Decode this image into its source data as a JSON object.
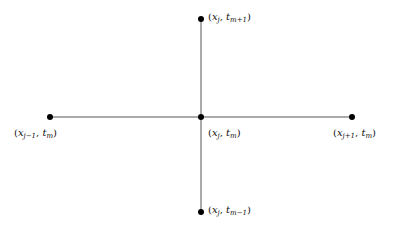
{
  "diagram": {
    "type": "finite-difference-stencil",
    "nodes": [
      {
        "id": "top",
        "x": 201,
        "y": 19,
        "var": "x",
        "var_sub": "j",
        "time": "t",
        "time_sub": "m+1"
      },
      {
        "id": "left",
        "x": 50,
        "y": 117,
        "var": "x",
        "var_sub": "j−1",
        "time": "t",
        "time_sub": "m"
      },
      {
        "id": "center",
        "x": 201,
        "y": 117,
        "var": "x",
        "var_sub": "j",
        "time": "t",
        "time_sub": "m"
      },
      {
        "id": "right",
        "x": 352,
        "y": 117,
        "var": "x",
        "var_sub": "j+1",
        "time": "t",
        "time_sub": "m"
      },
      {
        "id": "bottom",
        "x": 201,
        "y": 212,
        "var": "x",
        "var_sub": "j",
        "time": "t",
        "time_sub": "m−1"
      }
    ],
    "edges": [
      {
        "from": "left",
        "to": "right"
      },
      {
        "from": "top",
        "to": "bottom"
      }
    ],
    "colors": {
      "line": "#555555",
      "node": "#000000",
      "text": "#111111"
    }
  }
}
